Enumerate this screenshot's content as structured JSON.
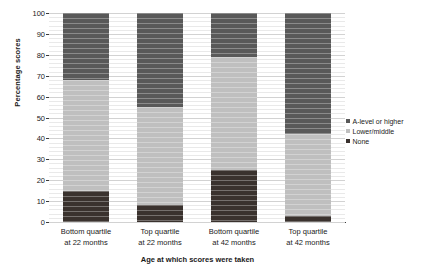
{
  "chart_data": {
    "type": "bar",
    "stacked": true,
    "stacked_normalized": true,
    "title": "",
    "subtitle": "",
    "xlabel": "Age at which scores were taken",
    "ylabel": "Percentage scores",
    "ylim": [
      0,
      100
    ],
    "ytick_step": 10,
    "yticks": [
      0,
      10,
      20,
      30,
      40,
      50,
      60,
      70,
      80,
      90,
      100
    ],
    "ytick_labels": [
      "0",
      "10",
      "20",
      "30",
      "40",
      "50",
      "60",
      "70",
      "80",
      "90",
      "100"
    ],
    "minor_gridlines": true,
    "minor_grid_step": 2,
    "grid": true,
    "legend_position": "right",
    "categories": [
      "Bottom quartile at 22 months",
      "Top quartile at 22 months",
      "Bottom quartile at 42 months",
      "Top quartile at 42 months"
    ],
    "category_lines": [
      [
        "Bottom quartile",
        "at 22 months"
      ],
      [
        "Top quartile",
        "at 22 months"
      ],
      [
        "Bottom quartile",
        "at 42 months"
      ],
      [
        "Top quartile",
        "at 42 months"
      ]
    ],
    "series": [
      {
        "name": "A-level or higher",
        "color": "#595959",
        "values": [
          32,
          45,
          21,
          58
        ]
      },
      {
        "name": "Lower/middle",
        "color": "#bfbfbf",
        "values": [
          53,
          47,
          54,
          39
        ]
      },
      {
        "name": "None",
        "color": "#3a322e",
        "values": [
          15,
          8,
          25,
          3
        ]
      }
    ]
  },
  "legend": {
    "items": [
      {
        "label": "A-level or higher",
        "color": "#595959"
      },
      {
        "label": "Lower/middle",
        "color": "#bfbfbf"
      },
      {
        "label": "None",
        "color": "#3a322e"
      }
    ]
  },
  "axes": {
    "y_title": "Percentage scores",
    "x_title": "Age at which scores were taken"
  }
}
